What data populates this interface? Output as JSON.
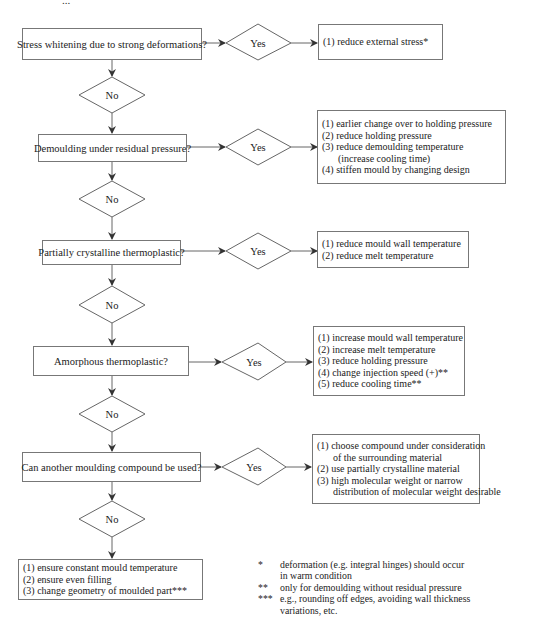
{
  "top_fragment": "...",
  "flow": {
    "questions": [
      {
        "id": "q1",
        "text": "Stress whitening due to strong deformations?",
        "yes_label": "Yes",
        "no_label": "No",
        "actions": [
          "(1) reduce external stress*"
        ]
      },
      {
        "id": "q2",
        "text": "Demoulding under residual pressure?",
        "yes_label": "Yes",
        "no_label": "No",
        "actions": [
          "(1) earlier change over to holding pressure",
          "(2) reduce holding pressure",
          "(3) reduce demoulding temperature",
          "(increase cooling time)",
          "(4) stiffen mould by changing design"
        ]
      },
      {
        "id": "q3",
        "text": "Partially crystalline thermoplastic?",
        "yes_label": "Yes",
        "no_label": "No",
        "actions": [
          "(1) reduce mould wall temperature",
          "(2) reduce melt temperature"
        ]
      },
      {
        "id": "q4",
        "text": "Amorphous thermoplastic?",
        "yes_label": "Yes",
        "no_label": "No",
        "actions": [
          "(1) increase mould wall temperature",
          "(2) increase melt temperature",
          "(3) reduce holding pressure",
          "(4) change injection speed (+)**",
          "(5) reduce cooling time**"
        ]
      },
      {
        "id": "q5",
        "text": "Can another moulding compound be used?",
        "yes_label": "Yes",
        "no_label": "No",
        "actions": [
          "(1) choose compound under consideration",
          "of the surrounding material",
          "(2) use partially crystalline material",
          "(3) high molecular weight or narrow",
          "distribution of molecular weight desirable"
        ]
      }
    ],
    "final_actions": [
      "(1) ensure constant mould temperature",
      "(2) ensure even filling",
      "(3) change geometry of moulded part***"
    ]
  },
  "footnotes": [
    {
      "mark": "*",
      "lines": [
        "deformation (e.g. integral hinges) should occur",
        "in warm condition"
      ]
    },
    {
      "mark": "**",
      "lines": [
        "only for demoulding without residual pressure"
      ]
    },
    {
      "mark": "***",
      "lines": [
        "e.g., rounding off edges, avoiding wall thickness",
        "variations, etc."
      ]
    }
  ]
}
